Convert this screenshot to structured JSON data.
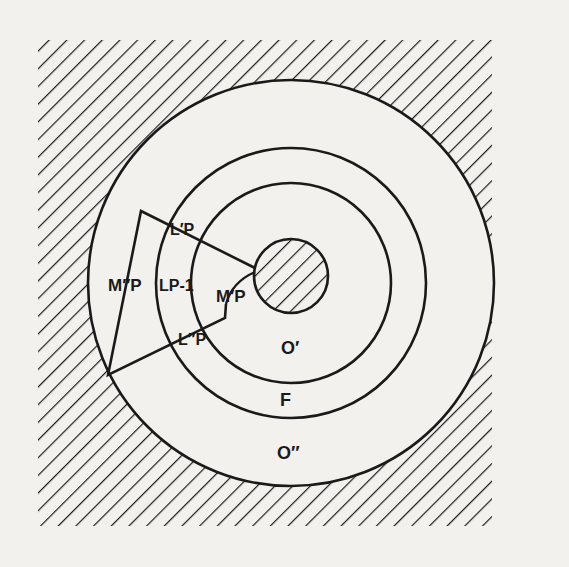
{
  "figure": {
    "type": "concentric-region-diagram",
    "colors": {
      "ink": "#1a1a1a",
      "paper": "#f2f1ee"
    },
    "regions": {
      "outer_hatched": "hatched exterior",
      "core_hatched": "hatched core"
    },
    "labels": {
      "m_double_prime_p": "M″P",
      "l_prime_p": "L′P",
      "l_p_minus_1": "LP-1",
      "m_prime_p": "M′P",
      "l_double_prime_p": "L″P",
      "o_prime": "O′",
      "f": "F",
      "o_double_prime": "O″"
    }
  }
}
